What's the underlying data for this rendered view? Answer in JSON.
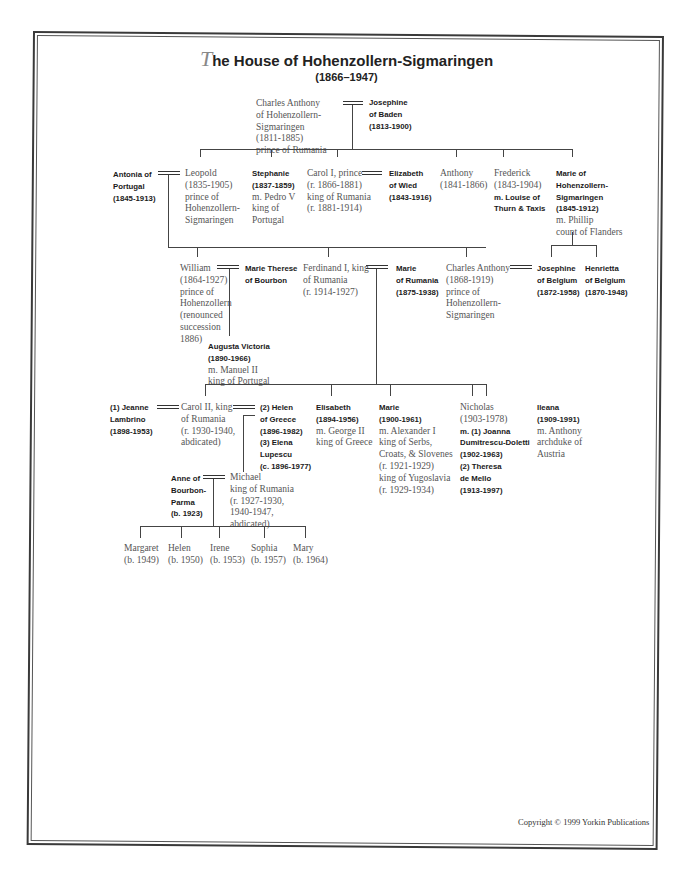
{
  "title": {
    "dropcap": "T",
    "rest": "he House of Hohenzollern-Sigmaringen",
    "subtitle": "(1866–1947)"
  },
  "people": {
    "charles_anthony_sr": [
      "Charles Anthony",
      "of Hohenzollern-",
      "Sigmaringen",
      "(1811-1885)",
      "prince of Rumania"
    ],
    "josephine_baden": [
      "Josephine",
      "of Baden",
      "(1813-1900)"
    ],
    "antonia": [
      "Antonia of",
      "Portugal",
      "(1845-1913)"
    ],
    "leopold": [
      "Leopold",
      "(1835-1905)",
      "prince of",
      "Hohenzollern-",
      "Sigmaringen"
    ],
    "stephanie": {
      "bold": [
        "Stephanie",
        "(1837-1859)"
      ],
      "serif": [
        "m. Pedro V",
        "king of",
        "Portugal"
      ]
    },
    "carol_i": [
      "Carol I, prince",
      "(r. 1866-1881)",
      "king of Rumania",
      "(r. 1881-1914)"
    ],
    "elizabeth_wied": [
      "Elizabeth",
      "of Wied",
      "(1843-1916)"
    ],
    "anthony": [
      "Anthony",
      "(1841-1866)"
    ],
    "frederick": {
      "serif": [
        "Frederick",
        "(1843-1904)"
      ],
      "bold": [
        "m. Louise of",
        "Thurn & Taxis"
      ]
    },
    "marie_hs": {
      "bold": [
        "Marie of",
        "Hohenzollern-",
        "Sigmaringen",
        "(1845-1912)"
      ],
      "serif": [
        "m. Phillip",
        "count of Flanders"
      ]
    },
    "william": [
      "William",
      "(1864-1927)",
      "prince of",
      "Hohenzollern",
      "(renounced",
      "succession",
      "1886)"
    ],
    "marie_therese": [
      "Marie Therese",
      "of Bourbon"
    ],
    "ferdinand": [
      "Ferdinand I, king",
      "of Rumania",
      "(r. 1914-1927)"
    ],
    "marie_rumania": [
      "Marie",
      "of Rumania",
      "(1875-1938)"
    ],
    "charles_anthony_jr": [
      "Charles Anthony",
      "(1868-1919)",
      "prince of",
      "Hohenzollern-",
      "Sigmaringen"
    ],
    "josephine_belgium": [
      "Josephine",
      "of Belgium",
      "(1872-1958)"
    ],
    "henrietta_belgium": [
      "Henrietta",
      "of Belgium",
      "(1870-1948)"
    ],
    "augusta_victoria": {
      "bold": [
        "Augusta Victoria",
        "(1890-1966)"
      ],
      "serif": [
        "m. Manuel II",
        "king of  Portugal"
      ]
    },
    "jeanne": [
      "(1) Jeanne",
      "Lambrino",
      "(1898-1953)"
    ],
    "carol_ii": [
      "Carol II, king",
      "of Rumania",
      "(r. 1930-1940,",
      "abdicated)"
    ],
    "helen_elena": [
      "(2) Helen",
      "of Greece",
      "(1896-1982)",
      "(3) Elena",
      "Lupescu",
      "(c. 1896-1977)"
    ],
    "elisabeth": {
      "bold": [
        "Elisabeth",
        "(1894-1956)"
      ],
      "serif": [
        "m. George II",
        "king of Greece"
      ]
    },
    "marie_1900": {
      "bold": [
        "Marie",
        "(1900-1961)"
      ],
      "serif": [
        "m. Alexander I",
        "king of Serbs,",
        "Croats, & Slovenes",
        "(r. 1921-1929)",
        "king of Yugoslavia",
        "(r. 1929-1934)"
      ]
    },
    "nicholas": {
      "serif": [
        "Nicholas",
        "(1903-1978)"
      ],
      "bold": [
        "m. (1) Joanna",
        "Dumitrescu-Doletti",
        "(1902-1963)",
        "(2) Theresa",
        "de Mello",
        "(1913-1997)"
      ]
    },
    "ileana": {
      "bold": [
        "Ileana",
        "(1909-1991)"
      ],
      "serif": [
        "m. Anthony",
        "archduke of",
        "Austria"
      ]
    },
    "anne": [
      "Anne of",
      "Bourbon-",
      "Parma",
      "(b. 1923)"
    ],
    "michael": [
      "Michael",
      "king of Rumania",
      "(r. 1927-1930,",
      "1940-1947,",
      "abdicated)"
    ],
    "children": [
      [
        "Margaret",
        "(b. 1949)"
      ],
      [
        "Helen",
        "(b. 1950)"
      ],
      [
        "Irene",
        "(b. 1953)"
      ],
      [
        "Sophia",
        "(b. 1957)"
      ],
      [
        "Mary",
        "(b. 1964)"
      ]
    ]
  },
  "copyright": "Copyright © 1999 Yorkin Publications"
}
